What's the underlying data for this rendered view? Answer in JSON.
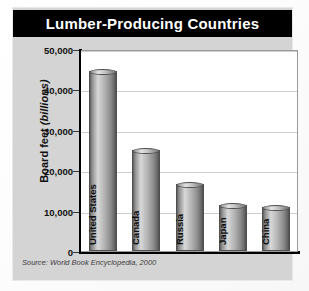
{
  "figure": {
    "title": "Lumber-Producing Countries",
    "source_note": "Source: World Book Encyclopedia, 2000",
    "y_axis_label_main": "Board feet ",
    "y_axis_label_italic": "(billions)",
    "colors": {
      "title_bar_background": "#000000",
      "title_text": "#ffffff",
      "panel_background": "#d4d4d4",
      "plot_background": "#ffffff",
      "gridline": "#cfcfcf",
      "axis_line": "#000000",
      "bar_light": "#d8d8d8",
      "bar_dark": "#4f4f4f",
      "label_text": "#0d0d0d"
    }
  },
  "chart_data": {
    "type": "bar",
    "title": "Lumber-Producing Countries",
    "xlabel": "",
    "ylabel": "Board feet (billions)",
    "categories": [
      "United States",
      "Canada",
      "Russia",
      "Japan",
      "China"
    ],
    "values": [
      44500,
      25000,
      16500,
      11500,
      11000
    ],
    "ylim": [
      0,
      50000
    ],
    "ytick_labels": [
      "50,000",
      "40,000",
      "30,000",
      "20,000",
      "10,000",
      "0"
    ],
    "ytick_values": [
      50000,
      40000,
      30000,
      20000,
      10000,
      0
    ],
    "grid": true,
    "legend": "none",
    "source": "Source: World Book Encyclopedia, 2000"
  }
}
